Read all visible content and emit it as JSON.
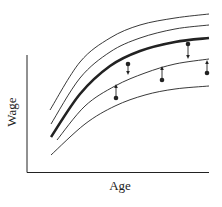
{
  "chart_data": {
    "type": "line",
    "title": "",
    "xlabel": "Age",
    "ylabel": "Wage",
    "grid": false,
    "legend": null,
    "ticks": {
      "x": [],
      "y": []
    },
    "series": [
      {
        "name": "profile-1",
        "style": "thin",
        "points": [
          [
            50,
            110
          ],
          [
            80,
            62
          ],
          [
            110,
            38
          ],
          [
            140,
            25
          ],
          [
            175,
            18
          ],
          [
            209,
            14
          ]
        ]
      },
      {
        "name": "profile-2",
        "style": "thin",
        "points": [
          [
            51,
            124
          ],
          [
            80,
            78
          ],
          [
            110,
            52
          ],
          [
            140,
            38
          ],
          [
            175,
            29
          ],
          [
            209,
            25
          ]
        ]
      },
      {
        "name": "average-profile",
        "style": "thick",
        "points": [
          [
            51,
            137
          ],
          [
            80,
            94
          ],
          [
            110,
            66
          ],
          [
            140,
            51
          ],
          [
            175,
            42
          ],
          [
            209,
            38
          ]
        ]
      },
      {
        "name": "profile-4",
        "style": "thin",
        "points": [
          [
            57,
            140
          ],
          [
            85,
            106
          ],
          [
            115,
            86
          ],
          [
            145,
            73
          ],
          [
            175,
            64
          ],
          [
            209,
            59
          ]
        ]
      },
      {
        "name": "profile-5",
        "style": "thin",
        "points": [
          [
            51,
            155
          ],
          [
            85,
            124
          ],
          [
            115,
            106
          ],
          [
            145,
            95
          ],
          [
            175,
            89
          ],
          [
            209,
            86
          ]
        ]
      }
    ],
    "observations": [
      {
        "x": 116,
        "y": 98,
        "arrow_to_y": 84,
        "direction": "up"
      },
      {
        "x": 128,
        "y": 64,
        "arrow_to_y": 75,
        "direction": "down"
      },
      {
        "x": 162,
        "y": 80,
        "arrow_to_y": 66,
        "direction": "up"
      },
      {
        "x": 188,
        "y": 44,
        "arrow_to_y": 59,
        "direction": "down"
      },
      {
        "x": 207,
        "y": 73,
        "arrow_to_y": 60,
        "direction": "up"
      }
    ]
  },
  "axes": {
    "x_label": "Age",
    "y_label": "Wage"
  },
  "colors": {
    "ink": "#222222",
    "background": "#ffffff"
  }
}
